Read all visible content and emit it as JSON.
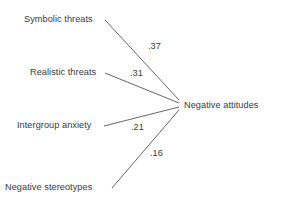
{
  "diagram": {
    "type": "path-diagram",
    "background_color": "#ffffff",
    "line_color": "#555555",
    "text_color": "#3a3a3a",
    "outcome": {
      "label": "Negative attitudes",
      "x": 184,
      "y": 100
    },
    "predictors": [
      {
        "label": "Symbolic threats",
        "x": 24,
        "y": 14,
        "coefficient": ".37",
        "coef_x": 148,
        "coef_y": 41
      },
      {
        "label": "Realistic threats",
        "x": 30,
        "y": 67,
        "coefficient": ".31",
        "coef_x": 130,
        "coef_y": 68
      },
      {
        "label": "Intergroup anxiety",
        "x": 17,
        "y": 120,
        "coefficient": ".21",
        "coef_x": 131,
        "coef_y": 122
      },
      {
        "label": "Negative stereotypes",
        "x": 5,
        "y": 182,
        "coefficient": ".16",
        "coef_x": 150,
        "coef_y": 148
      }
    ],
    "edges": [
      {
        "from": "Symbolic threats",
        "to": "Negative attitudes",
        "x1": 105,
        "y1": 20,
        "x2": 179,
        "y2": 100,
        "weight": ".37"
      },
      {
        "from": "Realistic threats",
        "to": "Negative attitudes",
        "x1": 105,
        "y1": 73,
        "x2": 179,
        "y2": 103,
        "weight": ".31"
      },
      {
        "from": "Intergroup anxiety",
        "to": "Negative attitudes",
        "x1": 104,
        "y1": 126,
        "x2": 179,
        "y2": 107,
        "weight": ".21"
      },
      {
        "from": "Negative stereotypes",
        "to": "Negative attitudes",
        "x1": 112,
        "y1": 188,
        "x2": 179,
        "y2": 110,
        "weight": ".16"
      }
    ]
  }
}
